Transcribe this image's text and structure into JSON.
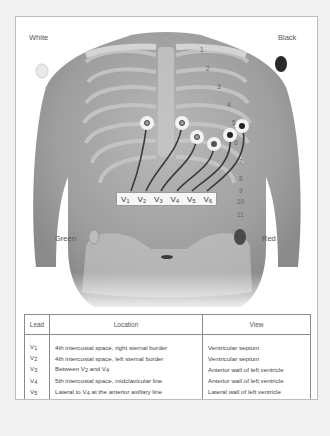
{
  "figure": {
    "limb_electrodes": [
      {
        "label": "White",
        "position": "right-shoulder",
        "color": "#e8e8e8"
      },
      {
        "label": "Black",
        "position": "left-shoulder",
        "color": "#2a2a2a"
      },
      {
        "label": "Green",
        "position": "right-lower-abdomen",
        "color": "#bcbcbc"
      },
      {
        "label": "Red",
        "position": "left-lower-abdomen",
        "color": "#4a4a4a"
      }
    ],
    "precordial_leads": [
      {
        "base": "V",
        "sub": "1"
      },
      {
        "base": "V",
        "sub": "2"
      },
      {
        "base": "V",
        "sub": "3"
      },
      {
        "base": "V",
        "sub": "4"
      },
      {
        "base": "V",
        "sub": "5"
      },
      {
        "base": "V",
        "sub": "6"
      }
    ],
    "rib_numbers": [
      "1",
      "2",
      "3",
      "4",
      "5",
      "6",
      "7",
      "8",
      "9",
      "10",
      "11"
    ]
  },
  "table": {
    "headers": {
      "lead": "Lead",
      "location": "Location",
      "view": "View"
    },
    "rows": [
      {
        "lead": "V",
        "lead_sub": "1",
        "location": "4th intercostal space, right sternal border",
        "view": "Ventricular septum"
      },
      {
        "lead": "V",
        "lead_sub": "2",
        "location": "4th intercostal space, left sternal border",
        "view": "Ventricular septum"
      },
      {
        "lead": "V",
        "lead_sub": "3",
        "location_pre": "Between V",
        "location_s1": "2",
        "location_mid": " and V",
        "location_s2": "4",
        "location": "Between V2 and V4",
        "view": "Anterior wall of left ventricle"
      },
      {
        "lead": "V",
        "lead_sub": "4",
        "location": "5th intercostal space, midclavicular line",
        "view": "Anterior wall of left ventricle"
      },
      {
        "lead": "V",
        "lead_sub": "5",
        "location_pre": "Lateral to V",
        "location_s1": "4",
        "location_mid": " at the anterior axillary line",
        "location": "Lateral to V4 at the anterior axillary line",
        "view": "Lateral wall of left ventricle"
      },
      {
        "lead": "V",
        "lead_sub": "6",
        "location_pre": "Lateral to V",
        "location_s1": "5",
        "location_mid": " at midaxillary line",
        "location": "Lateral to V5 at midaxillary line",
        "view": "Lateral wall of left ventricle"
      }
    ]
  }
}
